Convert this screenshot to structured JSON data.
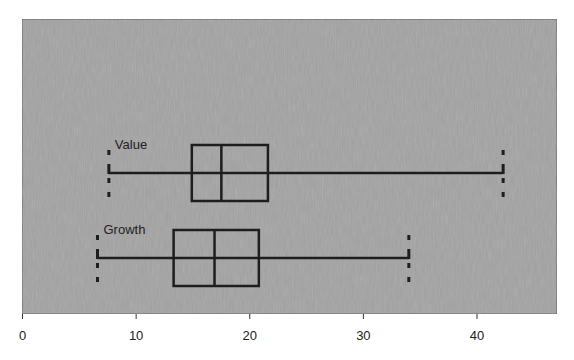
{
  "chart_data": {
    "type": "boxplot",
    "orientation": "horizontal",
    "title": "",
    "xlabel": "",
    "ylabel": "",
    "xlim": [
      0,
      47
    ],
    "xticks": [
      0,
      10,
      20,
      30,
      40
    ],
    "xtick_labels": [
      "0",
      "10",
      "20",
      "30",
      "40"
    ],
    "grid": false,
    "legend": null,
    "series": [
      {
        "name": "Value",
        "min": 7.6,
        "q1": 14.9,
        "median": 17.5,
        "q3": 21.6,
        "max": 42.3
      },
      {
        "name": "Growth",
        "min": 6.6,
        "q1": 13.3,
        "median": 16.9,
        "q3": 20.8,
        "max": 34.0
      }
    ]
  },
  "colors": {
    "plot_background": "#a3a3a3",
    "plot_border": "#5a5a5a",
    "box_stroke": "#1e1e1e",
    "text": "#222222",
    "page_background": "#ffffff"
  }
}
